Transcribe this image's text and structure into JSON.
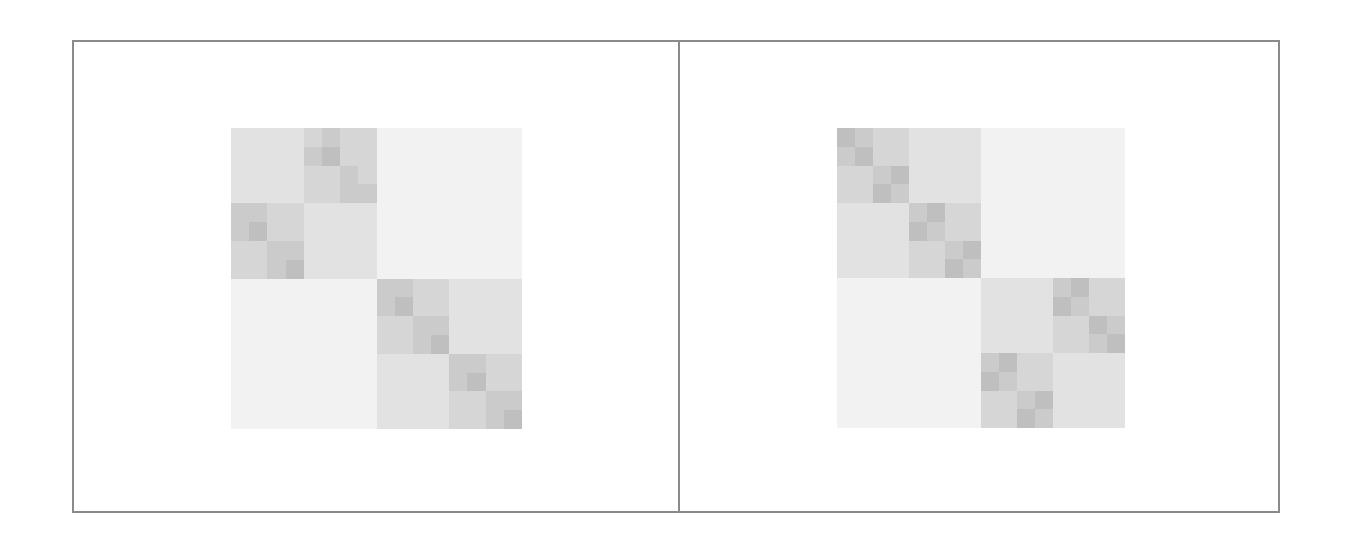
{
  "figure": {
    "frame_color": "#8a8a8a",
    "panels": [
      {
        "id": "left",
        "matrix_box": {
          "x": 231,
          "y": 128,
          "w": 291,
          "h": 301
        },
        "grid_size": 16,
        "palette": [
          "#f2f2f2",
          "#e2e2e2",
          "#d6d6d6",
          "#cbcbcb",
          "#bfbfbf"
        ],
        "pattern": "TL:[anti:[flat,main:[main,main],main:[main,main],flat]],BR:[main,...]",
        "cells": [
          [
            1,
            1,
            1,
            1,
            2,
            3,
            2,
            2,
            0,
            0,
            0,
            0,
            0,
            0,
            0,
            0
          ],
          [
            1,
            1,
            1,
            1,
            3,
            4,
            2,
            2,
            0,
            0,
            0,
            0,
            0,
            0,
            0,
            0
          ],
          [
            1,
            1,
            1,
            1,
            2,
            2,
            3,
            2,
            0,
            0,
            0,
            0,
            0,
            0,
            0,
            0
          ],
          [
            1,
            1,
            1,
            1,
            2,
            2,
            3,
            3,
            0,
            0,
            0,
            0,
            0,
            0,
            0,
            0
          ],
          [
            3,
            3,
            2,
            2,
            1,
            1,
            1,
            1,
            0,
            0,
            0,
            0,
            0,
            0,
            0,
            0
          ],
          [
            3,
            4,
            2,
            2,
            1,
            1,
            1,
            1,
            0,
            0,
            0,
            0,
            0,
            0,
            0,
            0
          ],
          [
            2,
            2,
            3,
            3,
            1,
            1,
            1,
            1,
            0,
            0,
            0,
            0,
            0,
            0,
            0,
            0
          ],
          [
            2,
            2,
            3,
            4,
            1,
            1,
            1,
            1,
            0,
            0,
            0,
            0,
            0,
            0,
            0,
            0
          ],
          [
            0,
            0,
            0,
            0,
            0,
            0,
            0,
            0,
            3,
            3,
            2,
            2,
            1,
            1,
            1,
            1
          ],
          [
            0,
            0,
            0,
            0,
            0,
            0,
            0,
            0,
            3,
            4,
            2,
            2,
            1,
            1,
            1,
            1
          ],
          [
            0,
            0,
            0,
            0,
            0,
            0,
            0,
            0,
            2,
            2,
            3,
            3,
            1,
            1,
            1,
            1
          ],
          [
            0,
            0,
            0,
            0,
            0,
            0,
            0,
            0,
            2,
            2,
            3,
            4,
            1,
            1,
            1,
            1
          ],
          [
            0,
            0,
            0,
            0,
            0,
            0,
            0,
            0,
            1,
            1,
            1,
            1,
            3,
            3,
            2,
            2
          ],
          [
            0,
            0,
            0,
            0,
            0,
            0,
            0,
            0,
            1,
            1,
            1,
            1,
            3,
            4,
            2,
            2
          ],
          [
            0,
            0,
            0,
            0,
            0,
            0,
            0,
            0,
            1,
            1,
            1,
            1,
            2,
            2,
            3,
            3
          ],
          [
            0,
            0,
            0,
            0,
            0,
            0,
            0,
            0,
            1,
            1,
            1,
            1,
            2,
            2,
            3,
            4
          ]
        ]
      },
      {
        "id": "right",
        "matrix_box": {
          "x": 837,
          "y": 128,
          "w": 288,
          "h": 300
        },
        "grid_size": 16,
        "palette": [
          "#f2f2f2",
          "#e2e2e2",
          "#d6d6d6",
          "#cbcbcb",
          "#bfbfbf"
        ],
        "pattern": "TL:[main:[main,main]],BR:[anti:[main,main]]",
        "cells": [
          [
            4,
            3,
            2,
            2,
            1,
            1,
            1,
            1,
            0,
            0,
            0,
            0,
            0,
            0,
            0,
            0
          ],
          [
            3,
            4,
            2,
            2,
            1,
            1,
            1,
            1,
            0,
            0,
            0,
            0,
            0,
            0,
            0,
            0
          ],
          [
            2,
            2,
            3,
            4,
            1,
            1,
            1,
            1,
            0,
            0,
            0,
            0,
            0,
            0,
            0,
            0
          ],
          [
            2,
            2,
            4,
            3,
            1,
            1,
            1,
            1,
            0,
            0,
            0,
            0,
            0,
            0,
            0,
            0
          ],
          [
            1,
            1,
            1,
            1,
            3,
            4,
            2,
            2,
            0,
            0,
            0,
            0,
            0,
            0,
            0,
            0
          ],
          [
            1,
            1,
            1,
            1,
            4,
            3,
            2,
            2,
            0,
            0,
            0,
            0,
            0,
            0,
            0,
            0
          ],
          [
            1,
            1,
            1,
            1,
            2,
            2,
            3,
            4,
            0,
            0,
            0,
            0,
            0,
            0,
            0,
            0
          ],
          [
            1,
            1,
            1,
            1,
            2,
            2,
            4,
            3,
            0,
            0,
            0,
            0,
            0,
            0,
            0,
            0
          ],
          [
            0,
            0,
            0,
            0,
            0,
            0,
            0,
            0,
            1,
            1,
            1,
            1,
            3,
            4,
            2,
            2
          ],
          [
            0,
            0,
            0,
            0,
            0,
            0,
            0,
            0,
            1,
            1,
            1,
            1,
            4,
            3,
            2,
            2
          ],
          [
            0,
            0,
            0,
            0,
            0,
            0,
            0,
            0,
            1,
            1,
            1,
            1,
            2,
            2,
            4,
            3
          ],
          [
            0,
            0,
            0,
            0,
            0,
            0,
            0,
            0,
            1,
            1,
            1,
            1,
            2,
            2,
            3,
            4
          ],
          [
            0,
            0,
            0,
            0,
            0,
            0,
            0,
            0,
            3,
            4,
            2,
            2,
            1,
            1,
            1,
            1
          ],
          [
            0,
            0,
            0,
            0,
            0,
            0,
            0,
            0,
            4,
            3,
            2,
            2,
            1,
            1,
            1,
            1
          ],
          [
            0,
            0,
            0,
            0,
            0,
            0,
            0,
            0,
            2,
            2,
            3,
            4,
            1,
            1,
            1,
            1
          ],
          [
            0,
            0,
            0,
            0,
            0,
            0,
            0,
            0,
            2,
            2,
            4,
            3,
            1,
            1,
            1,
            1
          ]
        ]
      }
    ]
  }
}
